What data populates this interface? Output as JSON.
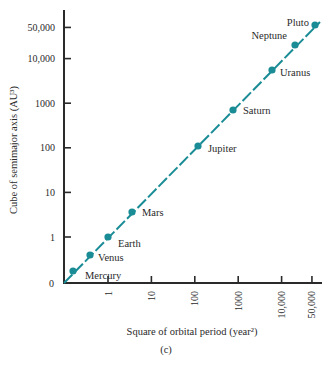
{
  "chart_data": {
    "type": "line",
    "title": "",
    "subtitle": "(c)",
    "xlabel": "Square of orbital period (year²)",
    "ylabel": "Cube of semimajor axis (AU³)",
    "origin_label": "0",
    "x_ticks": [
      "1",
      "10",
      "100",
      "1000",
      "10,000",
      "50,000"
    ],
    "y_ticks": [
      "1",
      "10",
      "100",
      "1000",
      "10,000",
      "50,000"
    ],
    "scale": "log-like (origin at 0)",
    "grid": false,
    "legend": null,
    "line_color": "#1a8c96",
    "series": [
      {
        "name": "Planets",
        "points": [
          {
            "label": "Mercury",
            "x": 0.058,
            "y": 0.058
          },
          {
            "label": "Venus",
            "x": 0.378,
            "y": 0.378
          },
          {
            "label": "Earth",
            "x": 1,
            "y": 1
          },
          {
            "label": "Mars",
            "x": 3.54,
            "y": 3.54
          },
          {
            "label": "Jupiter",
            "x": 140.7,
            "y": 140.7
          },
          {
            "label": "Saturn",
            "x": 867.9,
            "y": 867.9
          },
          {
            "label": "Uranus",
            "x": 7058,
            "y": 7058
          },
          {
            "label": "Neptune",
            "x": 27160,
            "y": 27160
          },
          {
            "label": "Pluto",
            "x": 61000,
            "y": 61000
          }
        ]
      }
    ]
  }
}
